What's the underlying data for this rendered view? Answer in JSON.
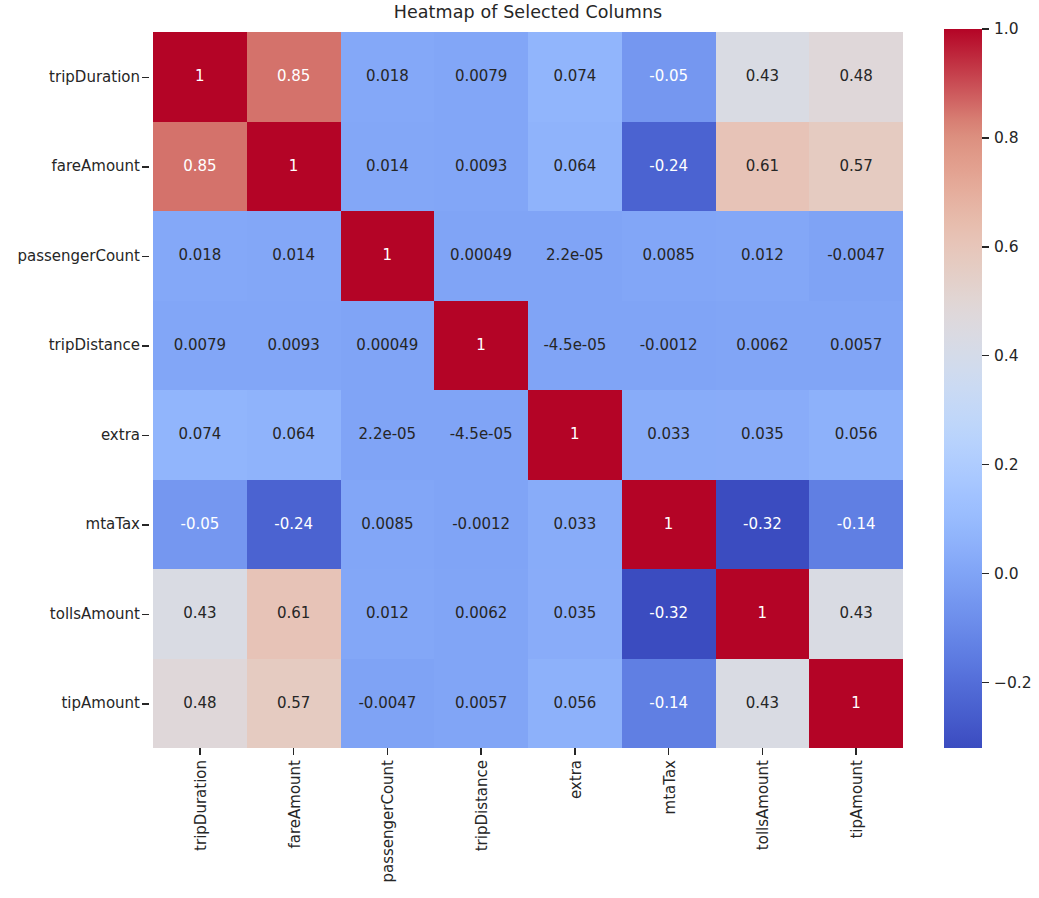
{
  "chart_data": {
    "type": "heatmap",
    "title": "Heatmap of Selected Columns",
    "xlabel": "",
    "ylabel": "",
    "grid": false,
    "colormap": "coolwarm",
    "annotated": true,
    "legend_position": "right-colorbar",
    "categories": [
      "tripDuration",
      "fareAmount",
      "passengerCount",
      "tripDistance",
      "extra",
      "mtaTax",
      "tollsAmount",
      "tipAmount"
    ],
    "x_tick_labels": [
      "tripDuration",
      "fareAmount",
      "passengerCount",
      "tripDistance",
      "extra",
      "mtaTax",
      "tollsAmount",
      "tipAmount"
    ],
    "y_tick_labels": [
      "tripDuration",
      "fareAmount",
      "passengerCount",
      "tripDistance",
      "extra",
      "mtaTax",
      "tollsAmount",
      "tipAmount"
    ],
    "values": [
      [
        1,
        0.85,
        0.018,
        0.0079,
        0.074,
        -0.05,
        0.43,
        0.48
      ],
      [
        0.85,
        1,
        0.014,
        0.0093,
        0.064,
        -0.24,
        0.61,
        0.57
      ],
      [
        0.018,
        0.014,
        1,
        0.00049,
        2.2e-05,
        0.0085,
        0.012,
        -0.0047
      ],
      [
        0.0079,
        0.0093,
        0.00049,
        1,
        -4.5e-05,
        -0.0012,
        0.0062,
        0.0057
      ],
      [
        0.074,
        0.064,
        2.2e-05,
        -4.5e-05,
        1,
        0.033,
        0.035,
        0.056
      ],
      [
        -0.05,
        -0.24,
        0.0085,
        -0.0012,
        0.033,
        1,
        -0.32,
        -0.14
      ],
      [
        0.43,
        0.61,
        0.012,
        0.0062,
        0.035,
        -0.32,
        1,
        0.43
      ],
      [
        0.48,
        0.57,
        -0.0047,
        0.0057,
        0.056,
        -0.14,
        0.43,
        1
      ]
    ],
    "cell_labels": [
      [
        "1",
        "0.85",
        "0.018",
        "0.0079",
        "0.074",
        "-0.05",
        "0.43",
        "0.48"
      ],
      [
        "0.85",
        "1",
        "0.014",
        "0.0093",
        "0.064",
        "-0.24",
        "0.61",
        "0.57"
      ],
      [
        "0.018",
        "0.014",
        "1",
        "0.00049",
        "2.2e-05",
        "0.0085",
        "0.012",
        "-0.0047"
      ],
      [
        "0.0079",
        "0.0093",
        "0.00049",
        "1",
        "-4.5e-05",
        "-0.0012",
        "0.0062",
        "0.0057"
      ],
      [
        "0.074",
        "0.064",
        "2.2e-05",
        "-4.5e-05",
        "1",
        "0.033",
        "0.035",
        "0.056"
      ],
      [
        "-0.05",
        "-0.24",
        "0.0085",
        "-0.0012",
        "0.033",
        "1",
        "-0.32",
        "-0.14"
      ],
      [
        "0.43",
        "0.61",
        "0.012",
        "0.0062",
        "0.035",
        "-0.32",
        "1",
        "0.43"
      ],
      [
        "0.48",
        "0.57",
        "-0.0047",
        "0.0057",
        "0.056",
        "-0.14",
        "0.43",
        "1"
      ]
    ],
    "colorbar": {
      "ticks": [
        1.0,
        0.8,
        0.6,
        0.4,
        0.2,
        0.0,
        -0.2
      ],
      "tick_labels": [
        "1.0",
        "0.8",
        "0.6",
        "0.4",
        "0.2",
        "0.0",
        "−0.2"
      ],
      "vmin": -0.32,
      "vmax": 1.0
    },
    "colors": {
      "high": "#b40426",
      "mid": "#dddddd",
      "low": "#3b4cc0",
      "text_dark": "#262626",
      "text_light": "#ffffff"
    }
  }
}
